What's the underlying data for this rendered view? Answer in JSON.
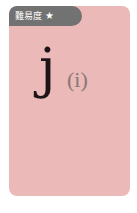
{
  "card": {
    "background_color": "#eab9b8",
    "difficulty_badge": {
      "label": "難易度",
      "star": "★",
      "color": "#737272"
    },
    "letter": "j",
    "reading": "(i)"
  }
}
